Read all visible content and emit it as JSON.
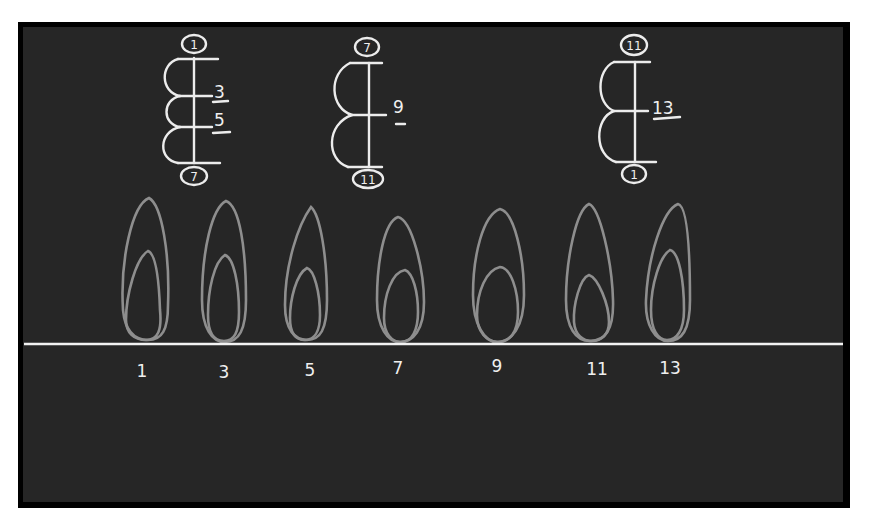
{
  "diagram": {
    "background_color": "#262626",
    "frame_color": "#000000",
    "chalk_color": "#ececec",
    "flame_color": "#8e8e8e",
    "cycles": [
      {
        "id": "cycle-1",
        "start": "1",
        "end": "7",
        "intermediates": [
          "3",
          "5"
        ]
      },
      {
        "id": "cycle-2",
        "start": "7",
        "end": "11",
        "intermediates": [
          "9"
        ]
      },
      {
        "id": "cycle-3",
        "start": "11",
        "end": "1",
        "intermediates": [
          "13"
        ]
      }
    ],
    "baseline_labels": [
      "1",
      "3",
      "5",
      "7",
      "9",
      "11",
      "13"
    ]
  }
}
